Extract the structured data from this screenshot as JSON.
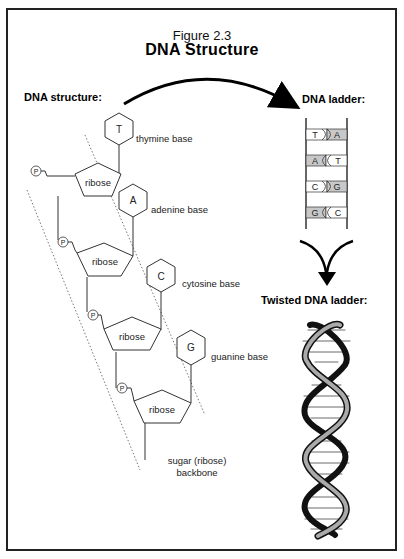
{
  "figure": {
    "number": "Figure 2.3",
    "title": "DNA Structure"
  },
  "sections": {
    "structure_heading": "DNA structure:",
    "ladder_heading": "DNA ladder:",
    "twisted_heading": "Twisted DNA ladder:"
  },
  "structure": {
    "units": [
      {
        "base_letter": "T",
        "base_label": "thymine base",
        "sugar_label": "ribose",
        "phosphate": "P"
      },
      {
        "base_letter": "A",
        "base_label": "adenine base",
        "sugar_label": "ribose",
        "phosphate": "P"
      },
      {
        "base_letter": "C",
        "base_label": "cytosine base",
        "sugar_label": "ribose",
        "phosphate": "P"
      },
      {
        "base_letter": "G",
        "base_label": "guanine base",
        "sugar_label": "ribose",
        "phosphate": "P"
      }
    ],
    "backbone_label_line1": "sugar (ribose)",
    "backbone_label_line2": "backbone"
  },
  "ladder": {
    "rungs": [
      {
        "left": "T",
        "right": "A",
        "shaded": "right"
      },
      {
        "left": "A",
        "right": "T",
        "shaded": "left"
      },
      {
        "left": "C",
        "right": "G",
        "shaded": "right"
      },
      {
        "left": "G",
        "right": "C",
        "shaded": "left"
      }
    ]
  },
  "colors": {
    "line": "#333333",
    "shade": "#c8c8c8",
    "frame": "#222222"
  }
}
